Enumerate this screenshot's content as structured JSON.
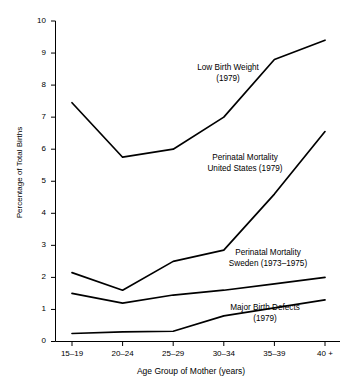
{
  "chart_data": {
    "type": "line",
    "title": "",
    "xlabel": "Age Group of Mother (years)",
    "ylabel": "Percentage of Total Births",
    "categories": [
      "15–19",
      "20–24",
      "25–29",
      "30–34",
      "35–39",
      "40 +"
    ],
    "x_tick_labels": [
      "15–19",
      "20–24",
      "25–29",
      "30–34",
      "35–39",
      "40 +"
    ],
    "y_tick_labels": [
      "0",
      "1",
      "2",
      "3",
      "4",
      "5",
      "6",
      "7",
      "8",
      "9",
      "10"
    ],
    "y_ticks": [
      0,
      1,
      2,
      3,
      4,
      5,
      6,
      7,
      8,
      9,
      10
    ],
    "ylim": [
      0,
      10
    ],
    "grid": false,
    "legend_position": "inline-annotations",
    "line_color": "#000000",
    "series": [
      {
        "name": "Low Birth Weight (1979)",
        "label_line1": "Low Birth Weight",
        "label_line2": "(1979)",
        "values": [
          7.45,
          5.75,
          6.0,
          7.0,
          8.8,
          9.4
        ]
      },
      {
        "name": "Perinatal Mortality United States (1979)",
        "label_line1": "Perinatal Mortality",
        "label_line2": "United States (1979)",
        "values": [
          2.15,
          1.6,
          2.5,
          2.85,
          4.6,
          6.55
        ]
      },
      {
        "name": "Perinatal Mortality Sweden (1973–1975)",
        "label_line1": "Perinatal Mortality",
        "label_line2": "Sweden (1973–1975)",
        "values": [
          1.5,
          1.2,
          1.45,
          1.6,
          1.8,
          2.0
        ]
      },
      {
        "name": "Major Birth Defects (1979)",
        "label_line1": "Major Birth Defects",
        "label_line2": "(1979)",
        "values": [
          0.25,
          0.3,
          0.32,
          0.8,
          1.05,
          1.3
        ]
      }
    ],
    "annotations": [
      {
        "text": "Low Birth Weight\n(1979)",
        "x_px": 228,
        "y_px": 73
      },
      {
        "text": "Perinatal Mortality\nUnited States (1979)",
        "x_px": 245,
        "y_px": 163
      },
      {
        "text": "Perinatal Mortality\nSweden (1973–1975)",
        "x_px": 268,
        "y_px": 258
      },
      {
        "text": "Major Birth Defects\n(1979)",
        "x_px": 265,
        "y_px": 313
      }
    ]
  }
}
